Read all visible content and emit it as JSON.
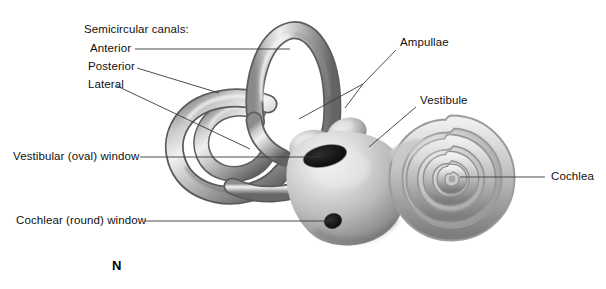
{
  "figure": {
    "plate_letter": "N",
    "background_color": "#ffffff",
    "line_color": "#3a3a3a",
    "text_color": "#111111",
    "structure_colors": {
      "highlight": "#f2f2f2",
      "midtone": "#b4b4b4",
      "shadow": "#6e6e6e",
      "deep_shadow": "#4a4a4a",
      "window_dark": "#1a1a1a"
    }
  },
  "labels": {
    "group_heading": "Semicircular canals:",
    "anterior": "Anterior",
    "posterior": "Posterior",
    "lateral": "Lateral",
    "vestibular_oval_window": "Vestibular (oval) window",
    "cochlear_round_window": "Cochlear (round) window",
    "ampullae": "Ampullae",
    "vestibule": "Vestibule",
    "cochlea": "Cochlea"
  }
}
